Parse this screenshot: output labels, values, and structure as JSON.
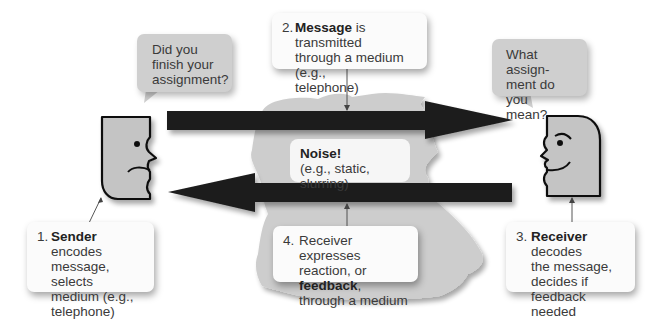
{
  "diagram": {
    "colors": {
      "arrow": "#1c1c1c",
      "face_fill": "#c4c4c4",
      "bubble_fill": "#cfcfcf",
      "callout_fill": "#fbfbfb",
      "noise_cloud": "#cdcdcd",
      "text": "#3a3a3a"
    },
    "sender_bubble": {
      "lines": [
        "Did you",
        "finish your",
        "assignment?"
      ]
    },
    "receiver_bubble": {
      "lines": [
        "What assign-",
        "ment do you",
        "mean?"
      ]
    },
    "callouts": [
      {
        "number": "1.",
        "bold": "Sender",
        "rest_first": " encodes",
        "lines": [
          "message, selects",
          "medium (e.g.,",
          "telephone)"
        ]
      },
      {
        "number": "2.",
        "bold": "Message",
        "rest_first": " is transmitted",
        "lines": [
          "through a medium (e.g.,",
          "telephone)"
        ]
      },
      {
        "number": "3.",
        "bold": "Receiver",
        "rest_first": " decodes",
        "lines": [
          "the message,",
          "decides if feedback",
          "needed"
        ]
      },
      {
        "number": "4.",
        "first": "Receiver expresses",
        "second_pre": "reaction, or ",
        "second_bold": "feedback",
        "second_post": ",",
        "third": "through a medium"
      }
    ],
    "noise": {
      "title": "Noise!",
      "subtitle": "(e.g., static, slurring)"
    },
    "icons": {
      "sender": "sender-face-icon",
      "receiver": "receiver-face-icon",
      "message_arrow": "right-arrow-icon",
      "feedback_arrow": "left-arrow-icon",
      "noise_cloud": "noise-cloud-shape"
    }
  }
}
